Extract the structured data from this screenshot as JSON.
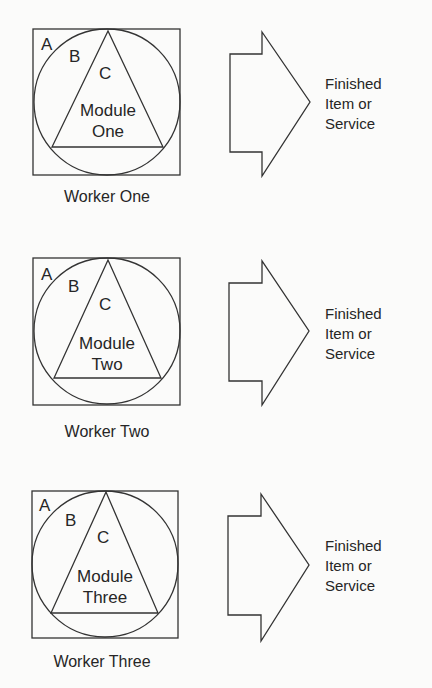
{
  "diagram": {
    "rows": [
      {
        "region_labels": {
          "outer": "A",
          "middle": "B",
          "inner": "C"
        },
        "module_label": [
          "Module",
          "One"
        ],
        "worker": "Worker One",
        "output": [
          "Finished",
          "Item or",
          "Service"
        ]
      },
      {
        "region_labels": {
          "outer": "A",
          "middle": "B",
          "inner": "C"
        },
        "module_label": [
          "Module",
          "Two"
        ],
        "worker": "Worker Two",
        "output": [
          "Finished",
          "Item or",
          "Service"
        ]
      },
      {
        "region_labels": {
          "outer": "A",
          "middle": "B",
          "inner": "C"
        },
        "module_label": [
          "Module",
          "Three"
        ],
        "worker": "Worker Three",
        "output": [
          "Finished",
          "Item or",
          "Service"
        ]
      }
    ],
    "colors": {
      "stroke": "#333333",
      "background": "#fbfbfa",
      "text": "#262626"
    }
  }
}
